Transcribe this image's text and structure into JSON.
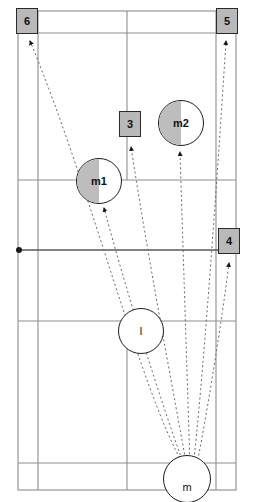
{
  "diagram": {
    "court": {
      "outer_left": 18,
      "outer_right": 236,
      "outer_top": 11,
      "outer_bottom": 490,
      "inner_left": 38,
      "inner_right": 216,
      "centre_line": 127,
      "net_y": 250,
      "top_doubles_service_y": 33,
      "top_short_service_y": 180,
      "bottom_short_service_y": 321,
      "bottom_doubles_service_y": 463
    },
    "colors": {
      "line": "#8a8a8a",
      "line_strong": "#5a5a5a",
      "marker_fill": "#b9b9b9",
      "marker_stroke": "#2a2a2a",
      "trajectory": "#6a6a6a",
      "text": "#111111"
    }
  },
  "targets": [
    {
      "id": "t6",
      "label": "6",
      "shape": "square",
      "shaded": true
    },
    {
      "id": "t5",
      "label": "5",
      "shape": "square",
      "shaded": true
    },
    {
      "id": "t3",
      "label": "3",
      "shape": "square",
      "shaded": true
    },
    {
      "id": "t4",
      "label": "4",
      "shape": "square",
      "shaded": true
    }
  ],
  "players": [
    {
      "id": "p_m1",
      "label": "m1",
      "shape": "circle",
      "half_shaded": true
    },
    {
      "id": "p_m2",
      "label": "m2",
      "shape": "circle",
      "half_shaded": true
    },
    {
      "id": "p_l",
      "label": "l",
      "shape": "circle",
      "half_shaded": false
    },
    {
      "id": "p_m",
      "label": "m",
      "shape": "circle",
      "half_shaded": false
    }
  ],
  "shots": {
    "origin": "m",
    "destinations": [
      "6",
      "m1",
      "3",
      "m2",
      "5",
      "4"
    ],
    "count": 6,
    "style": "dotted-arrow"
  }
}
